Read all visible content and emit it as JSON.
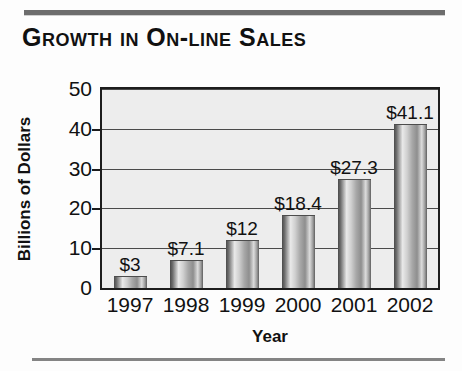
{
  "chart_data": {
    "type": "bar",
    "title": "Growth in On-line Sales",
    "xlabel": "Year",
    "ylabel": "Billions of Dollars",
    "categories": [
      "1997",
      "1998",
      "1999",
      "2000",
      "2001",
      "2002"
    ],
    "values": [
      3,
      7.1,
      12,
      18.4,
      27.3,
      41.1
    ],
    "data_labels": [
      "$3",
      "$7.1",
      "$12",
      "$18.4",
      "$27.3",
      "$41.1"
    ],
    "ylim": [
      0,
      50
    ],
    "yticks": [
      0,
      10,
      20,
      30,
      40,
      50
    ],
    "ytick_labels": [
      "0",
      "10",
      "20",
      "30",
      "40",
      "50"
    ],
    "grid": true,
    "legend": false,
    "bar_color": "#a8a8a8",
    "plot_background": "#ededed",
    "axis_color": "#1d1d1d"
  },
  "decoration": {
    "rule_color_top": "#6d6d6d",
    "rule_color_bottom": "#848484"
  }
}
